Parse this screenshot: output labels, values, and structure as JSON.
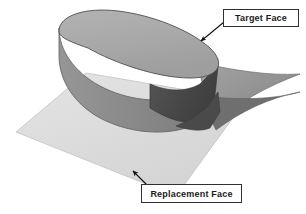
{
  "diagram": {
    "background_color": "#ffffff",
    "callouts": [
      {
        "id": "target-face",
        "label": "Target Face",
        "box_border_color": "#303030",
        "box_fill_color": "#ffffff",
        "text_color": "#1a1a1a",
        "leader_color": "#111111",
        "points_to": "top face of the extruded slot-shaped solid"
      },
      {
        "id": "replacement-face",
        "label": "Replacement Face",
        "box_border_color": "#303030",
        "box_fill_color": "#ffffff",
        "text_color": "#1a1a1a",
        "leader_color": "#111111",
        "points_to": "light gray base plane / curved replacement surface"
      }
    ],
    "geometry": {
      "base_plane": {
        "name": "replacement-plane",
        "fill": "#dedede",
        "stroke": "#b4b4b4"
      },
      "solid_top_face": {
        "name": "target-face-surface",
        "fill": "#a9a9a9",
        "stroke": "#4a4a4a"
      },
      "solid_side_light": {
        "name": "cylindrical-wall-lit",
        "fill": "#8d8d8d",
        "stroke": "#545454"
      },
      "solid_side_dark": {
        "name": "cylindrical-wall-shadow",
        "fill": "#4a4a4a",
        "stroke": "#3a3a3a"
      },
      "curved_sheet": {
        "name": "swept-replacement-sheet",
        "fill": "#9a9a9a",
        "stroke": "#6a6a6a"
      },
      "curved_sheet_shadow": {
        "name": "swept-sheet-shadow",
        "fill": "#6f6f6f"
      }
    }
  }
}
